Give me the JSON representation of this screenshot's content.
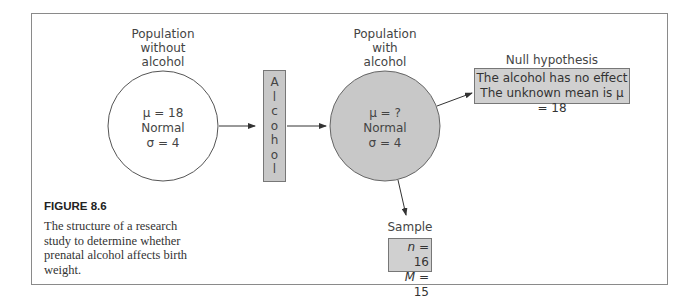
{
  "figure": {
    "number": "FIGURE 8.6",
    "caption": "The structure of a research study to determine whether prenatal alcohol affects birth weight."
  },
  "population_without": {
    "label_lines": [
      "Population",
      "without",
      "alcohol"
    ],
    "mean": "μ = 18",
    "shape": "Normal",
    "sd": "σ = 4"
  },
  "treatment": {
    "letters": [
      "A",
      "l",
      "c",
      "o",
      "h",
      "o",
      "l"
    ]
  },
  "population_with": {
    "label_lines": [
      "Population",
      "with",
      "alcohol"
    ],
    "mean": "μ = ?",
    "shape": "Normal",
    "sd": "σ = 4"
  },
  "null_hypothesis": {
    "title": "Null hypothesis",
    "line1": "The alcohol has no effect",
    "line2": "The unknown mean is μ = 18"
  },
  "sample": {
    "title": "Sample",
    "n_label": "n",
    "n_value": " = 16",
    "m_label": "M",
    "m_value": " = 15"
  },
  "colors": {
    "shaded_fill": "#c8c8c8",
    "border": "#777777",
    "frame": "#8a8a8a"
  }
}
